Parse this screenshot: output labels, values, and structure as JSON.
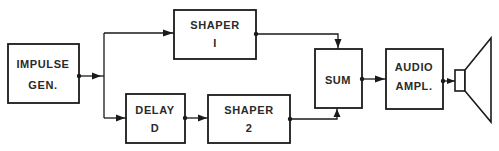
{
  "diagram": {
    "type": "block-diagram",
    "blocks": [
      {
        "id": "impulse-gen",
        "lines": [
          "IMPULSE",
          "GEN."
        ]
      },
      {
        "id": "shaper-1",
        "lines": [
          "SHAPER",
          "I"
        ]
      },
      {
        "id": "delay",
        "lines": [
          "DELAY",
          "D"
        ]
      },
      {
        "id": "shaper-2",
        "lines": [
          "SHAPER",
          "2"
        ]
      },
      {
        "id": "sum",
        "lines": [
          "SUM"
        ]
      },
      {
        "id": "audio-ampl",
        "lines": [
          "AUDIO",
          "AMPL."
        ]
      }
    ],
    "connections": [
      {
        "from": "impulse-gen",
        "to": "shaper-1"
      },
      {
        "from": "impulse-gen",
        "to": "delay"
      },
      {
        "from": "delay",
        "to": "shaper-2"
      },
      {
        "from": "shaper-1",
        "to": "sum"
      },
      {
        "from": "shaper-2",
        "to": "sum"
      },
      {
        "from": "sum",
        "to": "audio-ampl"
      },
      {
        "from": "audio-ampl",
        "to": "speaker"
      }
    ],
    "output_device": "speaker-icon"
  }
}
